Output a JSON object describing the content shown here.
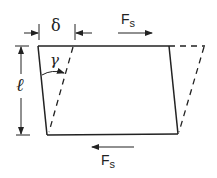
{
  "diagram": {
    "labels": {
      "delta": "δ",
      "gamma": "γ",
      "length": "ℓ",
      "force_top": "F",
      "force_top_sub": "s",
      "force_bottom": "F",
      "force_bottom_sub": "s"
    },
    "colors": {
      "line": "#222222",
      "background": "#ffffff"
    }
  }
}
